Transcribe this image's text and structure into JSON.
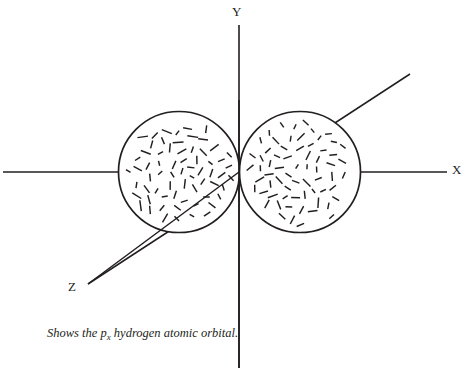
{
  "figure": {
    "background_color": "#ffffff",
    "ink_color": "#231f20",
    "width": 467,
    "height": 368,
    "caption_text_before": "Shows the p",
    "caption_subscript": "x",
    "caption_text_after": " hydrogen atomic orbital.",
    "caption_full": "Shows the px hydrogen atomic orbital.",
    "cropped_header_text": "",
    "axes": {
      "y": {
        "label": "Y",
        "x": 239,
        "y_top": 25,
        "y_bottom": 368
      },
      "x": {
        "label": "X",
        "y": 172,
        "x_left": 3,
        "x_right": 447
      },
      "z": {
        "label": "Z",
        "x_start": 88,
        "y_start": 284,
        "x_end": 410,
        "y_end": 74
      }
    },
    "lobes": [
      {
        "name": "left-lobe",
        "cx": 179,
        "cy": 172,
        "r": 60.5,
        "fill": "#ffffff",
        "stroke": "#231f20"
      },
      {
        "name": "right-lobe",
        "cx": 300,
        "cy": 172,
        "r": 60.5,
        "fill": "#ffffff",
        "stroke": "#231f20"
      }
    ],
    "fill_pattern": {
      "type": "random-short-dashes",
      "dash_length_min": 5,
      "dash_length_max": 11,
      "density_per_lobe": 150
    }
  },
  "chart_data": {
    "type": "scatter",
    "title": "Shows the px hydrogen atomic orbital.",
    "xlabel": "X",
    "ylabel": "Y",
    "zlabel": "Z",
    "legend": [],
    "grid": false,
    "annotations": [
      "X",
      "Y",
      "Z"
    ],
    "series": [
      {
        "name": "left-lobe",
        "shape": "circle",
        "center": [
          -1,
          0
        ],
        "radius": 1,
        "fill": "dashed-stipple"
      },
      {
        "name": "right-lobe",
        "shape": "circle",
        "center": [
          1,
          0
        ],
        "radius": 1,
        "fill": "dashed-stipple"
      }
    ],
    "xlim": [
      -3.9,
      3.4
    ],
    "ylim": [
      -3.2,
      2.4
    ]
  }
}
